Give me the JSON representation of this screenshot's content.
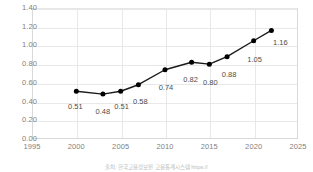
{
  "chart_data": {
    "type": "line",
    "title": "",
    "subtitle": "",
    "xlabel": "",
    "ylabel": "",
    "xlim": [
      1995,
      2025
    ],
    "ylim": [
      0.0,
      1.4
    ],
    "grid": true,
    "legend": "none",
    "marker": "filled-circle",
    "line_color": "#1a1a1a",
    "marker_color": "#000000",
    "x": [
      2000,
      2003,
      2005,
      2007,
      2010,
      2013,
      2015,
      2017,
      2020,
      2022
    ],
    "values": [
      0.51,
      0.48,
      0.51,
      0.58,
      0.74,
      0.82,
      0.8,
      0.88,
      1.05,
      1.16
    ],
    "point_labels": [
      "0.51",
      "0.48",
      "0.51",
      "0.58",
      "0.74",
      "0.82",
      "0.80",
      "0.88",
      "1.05",
      "1.16"
    ],
    "xticks": [
      "1995",
      "2000",
      "2005",
      "2010",
      "2015",
      "2020",
      "2025"
    ],
    "xtick_values": [
      1995,
      2000,
      2005,
      2010,
      2015,
      2020,
      2025
    ],
    "yticks": [
      "0.00",
      "0.20",
      "0.40",
      "0.60",
      "0.80",
      "1.00",
      "1.20",
      "1.40"
    ],
    "ytick_values": [
      0.0,
      0.2,
      0.4,
      0.6,
      0.8,
      1.0,
      1.2,
      1.4
    ]
  },
  "caption": {
    "text": "출처: 한국고용정보원 고용통계시스템 https://"
  }
}
